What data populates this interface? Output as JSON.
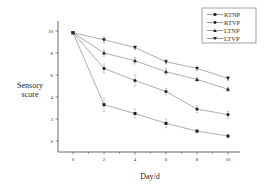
{
  "chart_data": {
    "type": "line",
    "title": "",
    "xlabel": "Day/d",
    "ylabel": "Sensory score",
    "x": [
      0,
      2,
      4,
      6,
      8,
      10
    ],
    "xticks": [
      0,
      2,
      4,
      6,
      8,
      10
    ],
    "yticks": [
      0,
      2,
      4,
      6,
      8,
      10
    ],
    "xlim": [
      -1.5,
      11
    ],
    "ylim": [
      -1,
      11
    ],
    "grid": false,
    "legend_position": "top-right",
    "series": [
      {
        "name": "RTNP",
        "marker": "square",
        "values": [
          9.85,
          3.3,
          2.5,
          1.6,
          0.9,
          0.45
        ],
        "errors": [
          0.1,
          0.6,
          0.4,
          0.4,
          0.15,
          0.15
        ]
      },
      {
        "name": "RTVP",
        "marker": "circle",
        "values": [
          9.85,
          6.6,
          5.5,
          4.5,
          2.9,
          2.4
        ],
        "errors": [
          0.1,
          0.4,
          0.5,
          0.3,
          0.3,
          0.3
        ]
      },
      {
        "name": "LTNP",
        "marker": "triangle-up",
        "values": [
          9.85,
          8.0,
          7.3,
          6.3,
          5.6,
          4.7
        ],
        "errors": [
          0.1,
          0.3,
          0.3,
          0.3,
          0.2,
          0.2
        ]
      },
      {
        "name": "LTVP",
        "marker": "triangle-down",
        "values": [
          9.85,
          9.2,
          8.5,
          7.2,
          6.6,
          5.7
        ],
        "errors": [
          0.1,
          0.3,
          0.2,
          0.2,
          0.2,
          0.2
        ]
      }
    ]
  }
}
